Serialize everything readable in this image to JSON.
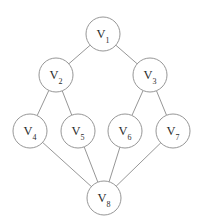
{
  "figure": {
    "type": "undirected-graph-diagram",
    "background_color": "#ffffff",
    "node_stroke_color": "#8a8a8a",
    "node_fill_color": "#ffffff",
    "edge_color": "#8a8a8a",
    "label_color": "#2b2b2b",
    "node_radius": 17
  },
  "nodes": [
    {
      "id": "v1",
      "label": "V",
      "subscript": "1",
      "full_label": "V₁",
      "cx": 103,
      "cy": 34
    },
    {
      "id": "v2",
      "label": "V",
      "subscript": "2",
      "full_label": "V₂",
      "cx": 56,
      "cy": 75
    },
    {
      "id": "v3",
      "label": "V",
      "subscript": "3",
      "full_label": "V₃",
      "cx": 150,
      "cy": 75
    },
    {
      "id": "v4",
      "label": "V",
      "subscript": "4",
      "full_label": "V₄",
      "cx": 30,
      "cy": 131
    },
    {
      "id": "v5",
      "label": "V",
      "subscript": "5",
      "full_label": "V₅",
      "cx": 78,
      "cy": 131
    },
    {
      "id": "v6",
      "label": "V",
      "subscript": "6",
      "full_label": "V₆",
      "cx": 125,
      "cy": 131
    },
    {
      "id": "v7",
      "label": "V",
      "subscript": "7",
      "full_label": "V₇",
      "cx": 173,
      "cy": 131
    },
    {
      "id": "v8",
      "label": "V",
      "subscript": "8",
      "full_label": "V₈",
      "cx": 104,
      "cy": 198
    }
  ],
  "edges": [
    {
      "id": "e1",
      "source": "v1",
      "target": "v2"
    },
    {
      "id": "e2",
      "source": "v1",
      "target": "v3"
    },
    {
      "id": "e3",
      "source": "v2",
      "target": "v4"
    },
    {
      "id": "e4",
      "source": "v2",
      "target": "v5"
    },
    {
      "id": "e5",
      "source": "v3",
      "target": "v6"
    },
    {
      "id": "e6",
      "source": "v3",
      "target": "v7"
    },
    {
      "id": "e7",
      "source": "v4",
      "target": "v8"
    },
    {
      "id": "e8",
      "source": "v5",
      "target": "v8"
    },
    {
      "id": "e9",
      "source": "v6",
      "target": "v8"
    },
    {
      "id": "e10",
      "source": "v7",
      "target": "v8"
    }
  ]
}
